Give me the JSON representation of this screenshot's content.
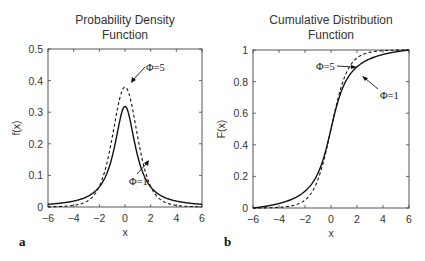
{
  "chart_data": [
    {
      "id": "a",
      "panel_label": "a",
      "type": "line",
      "title": "Probability Density Function",
      "title_lines": [
        "Probability Density",
        "Function"
      ],
      "xlabel": "x",
      "ylabel": "f(x)",
      "xlim": [
        -6,
        6
      ],
      "ylim": [
        0,
        0.5
      ],
      "xticks": [
        -6,
        -4,
        -2,
        0,
        2,
        4,
        6
      ],
      "xtick_labels": [
        "−6",
        "−4",
        "−2",
        "0",
        "2",
        "4",
        "6"
      ],
      "yticks": [
        0,
        0.1,
        0.2,
        0.3,
        0.4,
        0.5
      ],
      "ytick_labels": [
        "0",
        "0.1",
        "0.2",
        "0.3",
        "0.4",
        "0.5"
      ],
      "grid": false,
      "legend": "none (inline annotations)",
      "series": [
        {
          "name": "Φ=1",
          "style": "solid",
          "x": [
            -6,
            -4,
            -2,
            -1,
            0,
            1,
            2,
            4,
            6
          ],
          "values": [
            0.009,
            0.019,
            0.064,
            0.159,
            0.318,
            0.159,
            0.064,
            0.019,
            0.009
          ]
        },
        {
          "name": "Φ=5",
          "style": "dashed",
          "x": [
            -6,
            -4,
            -2,
            -1,
            0,
            1,
            2,
            4,
            6
          ],
          "values": [
            0.002,
            0.005,
            0.065,
            0.22,
            0.38,
            0.22,
            0.065,
            0.005,
            0.002
          ]
        }
      ],
      "annotations": [
        {
          "text": "Φ=5",
          "target": "dashed peak",
          "x": 0.1,
          "y": 0.38
        },
        {
          "text": "Φ=1",
          "target": "solid right flank",
          "x": 1.8,
          "y": 0.15
        }
      ]
    },
    {
      "id": "b",
      "panel_label": "b",
      "type": "line",
      "title": "Cumulative Distribution Function",
      "title_lines": [
        "Cumulative Distribution",
        "Function"
      ],
      "xlabel": "x",
      "ylabel": "F(x)",
      "xlim": [
        -6,
        6
      ],
      "ylim": [
        0,
        1
      ],
      "xticks": [
        -6,
        -4,
        -2,
        0,
        2,
        4,
        6
      ],
      "xtick_labels": [
        "−6",
        "−4",
        "−2",
        "0",
        "2",
        "4",
        "6"
      ],
      "yticks": [
        0,
        0.2,
        0.4,
        0.6,
        0.8,
        1
      ],
      "ytick_labels": [
        "0",
        "0.2",
        "0.4",
        "0.6",
        "0.8",
        "1"
      ],
      "grid": false,
      "legend": "none (inline annotations)",
      "series": [
        {
          "name": "Φ=1",
          "style": "solid",
          "x": [
            -6,
            -4,
            -2,
            -1,
            0,
            1,
            2,
            4,
            6
          ],
          "values": [
            0.0,
            0.06,
            0.18,
            0.3,
            0.5,
            0.7,
            0.82,
            0.94,
            1.0
          ]
        },
        {
          "name": "Φ=5",
          "style": "dashed",
          "x": [
            -6,
            -4,
            -2,
            -1,
            0,
            1,
            2,
            4,
            6
          ],
          "values": [
            0.0,
            0.04,
            0.16,
            0.3,
            0.5,
            0.7,
            0.84,
            0.96,
            1.0
          ]
        }
      ],
      "annotations": [
        {
          "text": "Φ=5",
          "target": "dashed curve near x≈2.3",
          "x": 2.3,
          "y": 0.86
        },
        {
          "text": "Φ=1",
          "target": "solid curve near x≈2",
          "x": 2.0,
          "y": 0.84
        }
      ]
    }
  ],
  "figure": {
    "titles": {
      "a_line1": "Probability Density",
      "a_line2": "Function",
      "b_line1": "Cumulative Distribution",
      "b_line2": "Function"
    },
    "labels": {
      "a_xlabel": "x",
      "a_ylabel": "f(x)",
      "b_xlabel": "x",
      "b_ylabel": "F(x)",
      "a_panel": "a",
      "b_panel": "b",
      "a_anno_phi5": "Φ=5",
      "a_anno_phi1": "Φ=1",
      "b_anno_phi5": "Φ=5",
      "b_anno_phi1": "Φ=1"
    },
    "colors": {
      "line": "#111111",
      "axis": "#444444",
      "text": "#333333"
    }
  }
}
